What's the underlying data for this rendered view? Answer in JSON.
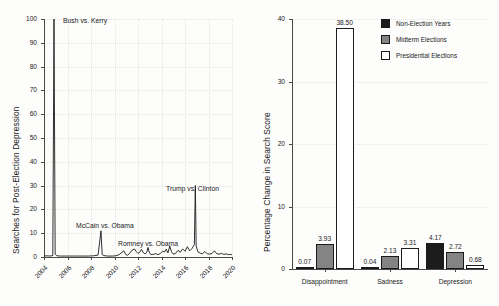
{
  "figure": {
    "background_color": "#fdfdfc",
    "panels": [
      "timeseries",
      "grouped-bar"
    ]
  },
  "chart_data": [
    {
      "type": "line",
      "panel": "left",
      "title": "",
      "xlabel": "",
      "ylabel": "Searches for Post-Election Depression",
      "xlim": [
        2004,
        2020
      ],
      "ylim": [
        0,
        100
      ],
      "grid": true,
      "legend_position": "none",
      "line_color": "#1a1a1a",
      "xticks": [
        "2004",
        "2006",
        "2008",
        "2010",
        "2012",
        "2014",
        "2016",
        "2018",
        "2020"
      ],
      "yticks": [
        "0",
        "10",
        "20",
        "30",
        "40",
        "50",
        "60",
        "70",
        "80",
        "90",
        "100"
      ],
      "annotations": [
        {
          "text": "Bush vs. Kerry",
          "x": 2004.85,
          "y": 100
        },
        {
          "text": "McCain vs. Obama",
          "x": 2008.7,
          "y": 11
        },
        {
          "text": "Romney vs. Obama",
          "x": 2012.85,
          "y": 4
        },
        {
          "text": "Trump vs. Clinton",
          "x": 2016.85,
          "y": 30
        }
      ],
      "x": [
        2004.0,
        2004.25,
        2004.5,
        2004.75,
        2004.85,
        2004.95,
        2005.1,
        2005.4,
        2005.8,
        2006.2,
        2006.6,
        2007.0,
        2007.4,
        2007.8,
        2008.2,
        2008.6,
        2008.85,
        2008.95,
        2009.1,
        2009.4,
        2009.8,
        2010.1,
        2010.4,
        2010.8,
        2010.95,
        2011.1,
        2011.3,
        2011.5,
        2011.7,
        2011.85,
        2012.0,
        2012.15,
        2012.3,
        2012.45,
        2012.6,
        2012.75,
        2012.85,
        2012.95,
        2013.1,
        2013.3,
        2013.5,
        2013.7,
        2013.9,
        2014.1,
        2014.25,
        2014.4,
        2014.55,
        2014.7,
        2014.85,
        2015.0,
        2015.2,
        2015.4,
        2015.6,
        2015.8,
        2016.0,
        2016.2,
        2016.4,
        2016.6,
        2016.8,
        2016.88,
        2016.95,
        2017.1,
        2017.3,
        2017.5,
        2017.7,
        2017.9,
        2018.1,
        2018.3,
        2018.5,
        2018.7,
        2018.9,
        2019.1,
        2019.3,
        2019.5,
        2019.7,
        2019.9,
        2020.0
      ],
      "y": [
        0.4,
        0.5,
        0.4,
        0.6,
        100,
        1.2,
        0.5,
        0.4,
        0.4,
        0.4,
        0.4,
        0.4,
        0.4,
        0.4,
        0.5,
        0.8,
        11,
        1.0,
        0.6,
        0.4,
        0.4,
        0.5,
        1.0,
        2.6,
        1.1,
        0.7,
        1.6,
        2.9,
        3.4,
        2.3,
        1.5,
        2.0,
        3.2,
        1.8,
        1.3,
        2.0,
        4.0,
        2.1,
        1.0,
        1.1,
        1.4,
        1.0,
        1.5,
        2.4,
        2.1,
        3.3,
        1.7,
        4.6,
        2.2,
        1.2,
        1.5,
        2.8,
        2.0,
        3.4,
        2.4,
        4.3,
        2.6,
        3.6,
        5.2,
        30,
        4.6,
        2.2,
        1.6,
        1.4,
        2.3,
        1.3,
        1.2,
        1.5,
        2.6,
        1.4,
        1.2,
        1.5,
        1.1,
        1.3,
        1.0,
        1.1,
        0.9
      ]
    },
    {
      "type": "bar",
      "panel": "right",
      "title": "",
      "xlabel": "",
      "ylabel": "Percentage Change in Search Score",
      "ylim": [
        0,
        40
      ],
      "grid": true,
      "legend_position": "top-right",
      "categories": [
        "Disappointment",
        "Sadness",
        "Depression"
      ],
      "yticks": [
        "0",
        "10",
        "20",
        "30",
        "40"
      ],
      "series": [
        {
          "name": "Non-Election Years",
          "color": "#1c1c1c",
          "values": [
            0.07,
            0.04,
            4.17
          ]
        },
        {
          "name": "Midterm Elections",
          "color": "#848484",
          "values": [
            3.93,
            2.13,
            2.72
          ]
        },
        {
          "name": "Presidential Elections",
          "color": "#ffffff",
          "values": [
            38.5,
            3.31,
            0.68
          ]
        }
      ],
      "value_labels": [
        [
          "0.07",
          "3.93",
          "38.50"
        ],
        [
          "0.04",
          "2.13",
          "3.31"
        ],
        [
          "4.17",
          "2.72",
          "0.68"
        ]
      ]
    }
  ],
  "left_chart": {
    "ylabel": "Searches for Post-Election Depression",
    "yticks": [
      "0",
      "10",
      "20",
      "30",
      "40",
      "50",
      "60",
      "70",
      "80",
      "90",
      "100"
    ],
    "xticks": [
      "2004",
      "2006",
      "2008",
      "2010",
      "2012",
      "2014",
      "2016",
      "2018",
      "2020"
    ],
    "annotations": [
      "Bush vs. Kerry",
      "McCain vs. Obama",
      "Romney vs. Obama",
      "Trump vs. Clinton"
    ]
  },
  "right_chart": {
    "ylabel": "Percentage Change in Search Score",
    "yticks": [
      "0",
      "10",
      "20",
      "30",
      "40"
    ],
    "categories": [
      "Disappointment",
      "Sadness",
      "Depression"
    ],
    "legend": [
      {
        "label": "Non-Election Years",
        "color": "#1c1c1c"
      },
      {
        "label": "Midterm Elections",
        "color": "#848484"
      },
      {
        "label": "Presidential Elections",
        "color": "#ffffff"
      }
    ],
    "bar_labels": {
      "disappointment": [
        "0.07",
        "3.93",
        "38.50"
      ],
      "sadness": [
        "0.04",
        "2.13",
        "3.31"
      ],
      "depression": [
        "4.17",
        "2.72",
        "0.68"
      ]
    }
  }
}
